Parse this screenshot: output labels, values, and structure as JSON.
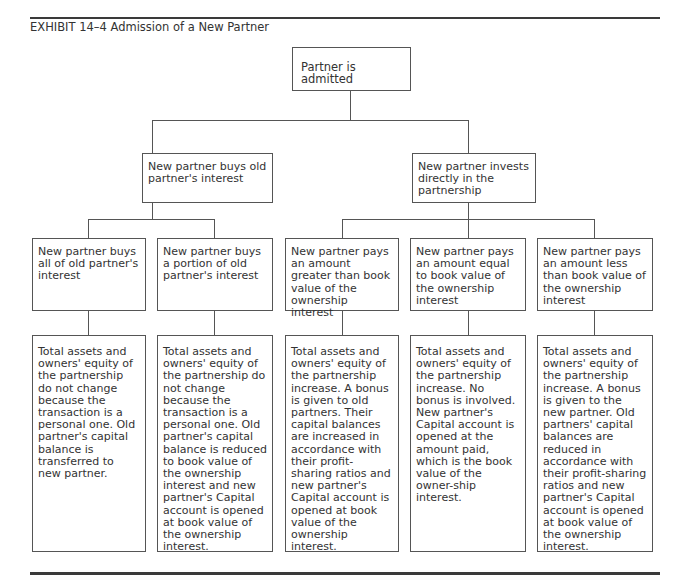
{
  "exhibit": {
    "title": "EXHIBIT 14–4 Admission of a New Partner"
  },
  "diagram": {
    "root": "Partner is admitted",
    "branches": [
      {
        "label": "New partner buys old partner's interest",
        "cases": [
          {
            "label": "New partner buys all of old partner's interest",
            "result": "Total assets and owners' equity of the partnership do not change because the transaction is a personal one. Old partner's capital balance is transferred to new partner."
          },
          {
            "label": "New partner buys a portion of old partner's interest",
            "result": "Total assets and owners' equity of the partnership do not change because the transaction is a personal one. Old partner's capital balance is reduced to book value of the ownership interest and new partner's Capital account is opened at book value of the ownership interest."
          }
        ]
      },
      {
        "label": "New partner invests directly in the partnership",
        "cases": [
          {
            "label": "New partner pays an amount greater than book value of the ownership interest",
            "result": "Total assets and owners' equity of the partnership increase. A bonus is given to old partners. Their capital balances are increased in accordance with their profit-sharing ratios and new partner's Capital account is opened at book value of the ownership interest."
          },
          {
            "label": "New partner pays an amount  equal to book value of the ownership interest",
            "result": "Total assets and owners' equity of the partnership increase. No bonus is involved. New partner's Capital account is opened at the amount paid, which is the book value of the owner-ship interest."
          },
          {
            "label": "New partner pays an amount  less than book value of the ownership interest",
            "result": "Total assets and owners' equity of the partnership increase. A bonus is given to the new partner. Old partners' capital balances are reduced in accordance with their profit-sharing ratios and new partner's Capital account is opened at book value of the ownership interest."
          }
        ]
      }
    ]
  }
}
